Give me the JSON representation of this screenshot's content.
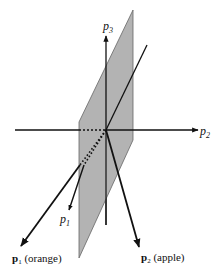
{
  "diagram": {
    "type": "3d-vector-space",
    "axes": {
      "p1": {
        "label": "p",
        "subscript": "1"
      },
      "p2": {
        "label": "p",
        "subscript": "2"
      },
      "p3": {
        "label": "p",
        "subscript": "3"
      }
    },
    "vectors": [
      {
        "name": "p1-orange",
        "label_bold": "p",
        "subscript": "1",
        "suffix": " (orange)"
      },
      {
        "name": "p2-apple",
        "label_bold": "p",
        "subscript": "2",
        "suffix": " (apple)"
      }
    ],
    "plane": {
      "fill": "#b3b3b3",
      "stroke": "#555555"
    },
    "colors": {
      "line": "#111111",
      "background": "#ffffff"
    }
  }
}
